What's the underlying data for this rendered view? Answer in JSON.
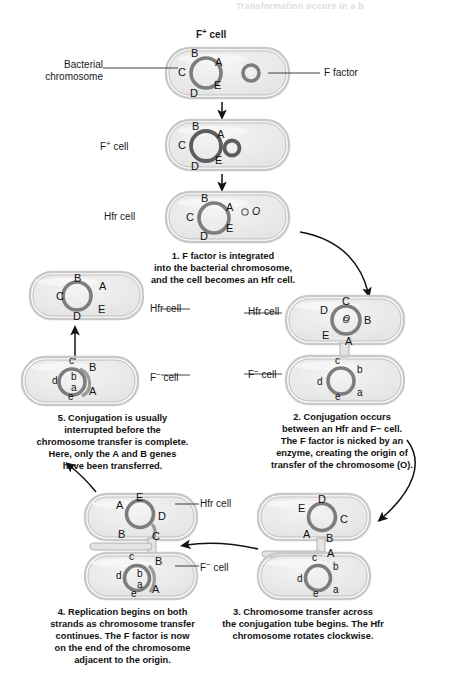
{
  "page": {
    "top_partial_text": "Transformation occurs in a b",
    "title_top": "F+ cell",
    "title_top_sup": "+"
  },
  "labels": {
    "bacterial_chromosome": "Bacterial\nchromosome",
    "f_factor": "F factor",
    "f_plus_cell": "F",
    "f_plus_sup": "+",
    "cell_word": "cell",
    "hfr_cell": "Hfr cell",
    "f_minus_cell": "F",
    "f_minus_sup": "−"
  },
  "stages": {
    "stage1": {
      "name": "F+ cell with free F factor",
      "cell_label": "F+ cell",
      "genes": [
        "B",
        "A",
        "C",
        "E",
        "D"
      ],
      "f_factor_present": true
    },
    "stage2": {
      "name": "F+ cell with F factor attaching",
      "cell_label": "F+ cell",
      "genes": [
        "B",
        "A",
        "C",
        "E",
        "D"
      ]
    },
    "stage3": {
      "name": "Hfr cell after integration",
      "cell_label": "Hfr cell",
      "genes": [
        "B",
        "A",
        "C",
        "E",
        "D"
      ],
      "origin_label": "O"
    },
    "stage4_pair": {
      "name": "Conjugating Hfr and F-minus pair",
      "hfr_label": "Hfr cell",
      "f_minus_label": "F− cell",
      "hfr_genes": [
        "C",
        "D",
        "B",
        "E",
        "A"
      ],
      "hfr_origin": "O",
      "f_minus_genes": [
        "c",
        "b",
        "d",
        "a",
        "e"
      ]
    },
    "stage5_pair": {
      "name": "Chromosome transfer beginning",
      "hfr_genes": [
        "D",
        "E",
        "C",
        "A",
        "B"
      ],
      "f_minus_genes": [
        "c",
        "b",
        "d",
        "a",
        "e"
      ],
      "transferred": [
        "A"
      ]
    },
    "stage6_pair": {
      "name": "Replication during transfer",
      "hfr_label": "Hfr cell",
      "f_minus_label": "F− cell",
      "hfr_genes": [
        "E",
        "A",
        "D",
        "B",
        "C"
      ],
      "f_minus_genes": [
        "c",
        "d",
        "b",
        "a",
        "e"
      ],
      "transferred": [
        "B",
        "A"
      ]
    },
    "stage7_hfr": {
      "name": "Hfr cell after interruption",
      "cell_label": "Hfr cell",
      "genes": [
        "B",
        "A",
        "C",
        "E",
        "D"
      ]
    },
    "stage7_fminus": {
      "name": "F-minus recombinant cell",
      "cell_label": "F− cell",
      "genes": [
        "c",
        "B",
        "d",
        "b",
        "a",
        "e",
        "A"
      ]
    }
  },
  "captions": {
    "step1": "1. F factor is integrated\ninto the bacterial chromosome,\nand the cell becomes an Hfr cell.",
    "step2": "2. Conjugation occurs\nbetween an Hfr and F− cell.\nThe F factor is nicked by an\nenzyme, creating the origin of\ntransfer of the chromosome (O).",
    "step3": "3. Chromosome transfer across\nthe conjugation tube begins. The Hfr\nchromosome rotates clockwise.",
    "step4": "4. Replication begins on both\nstrands as chromosome transfer\ncontinues. The F factor is now\non the end of the chromosome\nadjacent to the origin.",
    "step5": "5. Conjugation is usually\ninterrupted before the\nchromosome transfer is complete.\nHere, only the A and B genes\nhave been transferred."
  },
  "colors": {
    "cell_fill": "#ececec",
    "cell_stroke": "#b7b7b7",
    "chromosome_ring": "#7d7d7d",
    "text": "#111111",
    "arrow": "#111111"
  }
}
